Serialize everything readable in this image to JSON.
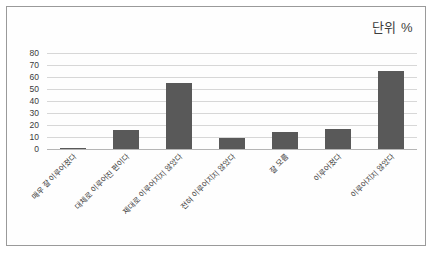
{
  "annotation": {
    "unit_note": "단위 %"
  },
  "chart_data": {
    "type": "bar",
    "title": "",
    "subtitle": "",
    "xlabel": "",
    "ylabel": "",
    "unit": "단위 %",
    "ylim": [
      0,
      80
    ],
    "yticks": [
      0,
      10,
      20,
      30,
      40,
      50,
      60,
      70,
      80
    ],
    "grid": true,
    "legend": "none",
    "orientation": "vertical",
    "bar_color": "#595959",
    "categories": [
      "매우 잘 이루어졌다",
      "대체로 이루어진 편이다",
      "제대로 이루어지지 않았다",
      "전혀 이루어지지 않았다",
      "잘 모름",
      "이루어졌다",
      "이루어지지 않았다"
    ],
    "values": [
      1,
      16,
      55,
      9,
      14,
      17,
      65
    ]
  }
}
